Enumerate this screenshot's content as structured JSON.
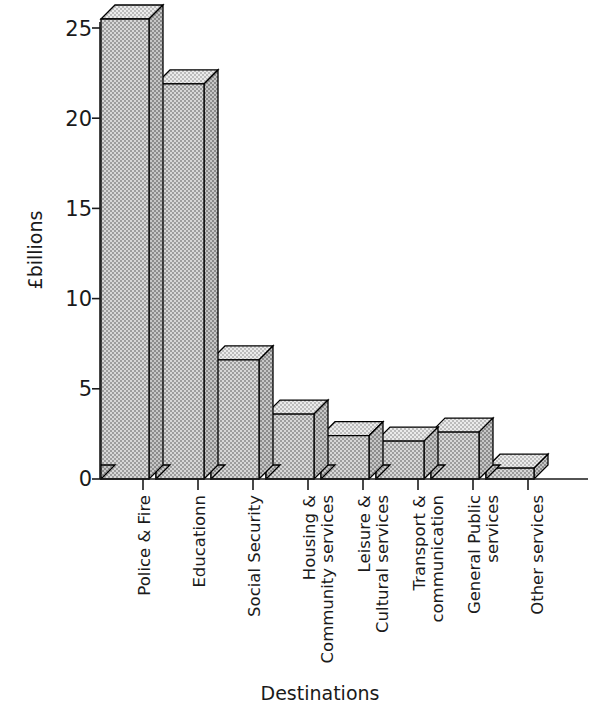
{
  "chart_data": {
    "type": "bar",
    "title": "",
    "xlabel": "Destinations",
    "ylabel": "£billions",
    "categories": [
      "Police & Fire",
      "Educationn",
      "Social Security",
      "Housing &\nCommunity services",
      "Leisure &\nCultural services",
      "Transport &\ncommunication",
      "General Public\nservices",
      "Other services"
    ],
    "values": [
      25.5,
      21.9,
      6.6,
      3.6,
      2.4,
      2.1,
      2.6,
      0.6
    ],
    "ylim": [
      0,
      25
    ],
    "yticks": [
      0,
      5,
      10,
      15,
      20,
      25
    ],
    "ytick_labels": [
      "0",
      "5",
      "10",
      "15",
      "20",
      "25"
    ],
    "grid": false,
    "legend": false,
    "note": "First bar is clipped by the top of the figure; style is 3D shaded bars with dithered grey fill"
  },
  "labels": {
    "ytick_0": "0",
    "ytick_1": "5",
    "ytick_2": "10",
    "ytick_3": "15",
    "ytick_4": "20",
    "ytick_5": "25",
    "y_axis_title": "£billions",
    "x_axis_title": "Destinations",
    "cat_0_line_0": "Police & Fire",
    "cat_0_line_1": "",
    "cat_1_line_0": "Educationn",
    "cat_1_line_1": "",
    "cat_2_line_0": "Social Security",
    "cat_2_line_1": "",
    "cat_3_line_0": "Housing &",
    "cat_3_line_1": "Community services",
    "cat_4_line_0": "Leisure &",
    "cat_4_line_1": "Cultural services",
    "cat_5_line_0": "Transport &",
    "cat_5_line_1": "communication",
    "cat_6_line_0": "General Public",
    "cat_6_line_1": "services",
    "cat_7_line_0": "Other services",
    "cat_7_line_1": ""
  },
  "colors": {
    "ink": "#1a1a1a",
    "outline": "#000000",
    "bar_front": "#c9c9c9",
    "bar_top": "#e2e2e2",
    "bar_side": "#a8a8a8",
    "background": "#ffffff"
  }
}
